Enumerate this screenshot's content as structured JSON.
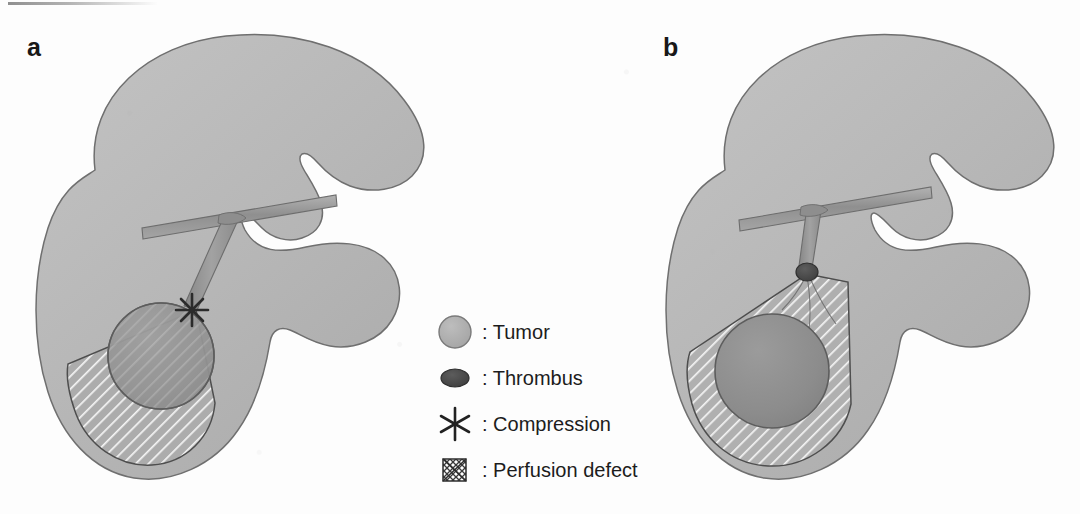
{
  "figure": {
    "panels": [
      {
        "id": "a",
        "label": "a",
        "mechanism": "Compression",
        "description": "Tumor compresses the portal vein branch producing a wedge-shaped perfusion defect",
        "marker": "asterisk"
      },
      {
        "id": "b",
        "label": "b",
        "mechanism": "Thrombus",
        "description": "Tumor thrombus occludes the portal vein branch producing a larger wedge-shaped perfusion defect",
        "marker": "thrombus"
      }
    ]
  },
  "legend": {
    "separator": ":",
    "items": [
      {
        "symbol": "tumor-circle",
        "label": ": Tumor"
      },
      {
        "symbol": "thrombus-ellipse",
        "label": ": Thrombus"
      },
      {
        "symbol": "asterisk",
        "label": ": Compression"
      },
      {
        "symbol": "crossed-box",
        "label": ": Perfusion defect"
      }
    ]
  },
  "colors": {
    "background": "#fdfdfd",
    "liver_fill": "#b9b9b9",
    "liver_stroke": "#6f6f6f",
    "vessel_fill": "#9a9a9a",
    "vessel_stroke": "#6d6d6d",
    "tumor_fill": "#8f8f8f",
    "tumor_stroke": "#5f5f5f",
    "thrombus_fill": "#4a4a4a",
    "defect_fill": "#aeaeae",
    "defect_stroke": "#4e4e4e",
    "hatch_line": "#f2f2f2",
    "text": "#1c1c1c"
  }
}
